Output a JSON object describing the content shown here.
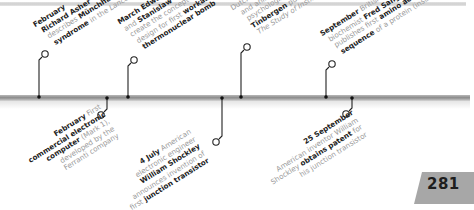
{
  "page": {
    "number": "281"
  },
  "colors": {
    "bar": "#8c8c8c",
    "connector": "#222222",
    "bold_text": "#222222",
    "muted_text": "#9a9a9a",
    "page_tab": "#a7a7a7"
  },
  "events_above": [
    {
      "month": "February",
      "lines": [
        "Richard Asher",
        "describes Münchhausen",
        "syndrome in the Lancet"
      ],
      "rich": [
        [
          "Richard Asher",
          "b"
        ],
        [
          "describes ",
          ""
        ],
        [
          "Münchhausen",
          "b"
        ],
        [
          "syndrome",
          "b"
        ],
        [
          " in the ",
          ""
        ],
        [
          "Lancet",
          "it"
        ]
      ]
    },
    {
      "month": "March",
      "text": "Edward Teller and Stanislaw Ulam create the concept design for first workable thermonuclear bomb"
    },
    {
      "month": "",
      "text": "Dutch zoologist and animal psychologist Niko Tinbergen publishes The Study of Instinct"
    },
    {
      "month": "September",
      "text": "British biochemist Fred Sanger publishes first amino acid sequence of a protein (insulin)"
    }
  ],
  "events_below": [
    {
      "month": "February",
      "text": "First commercial electronic computer (Mark 1), developed by the Ferranti company"
    },
    {
      "month": "4 July",
      "text": "American electronic engineer William Shockley announces invention of first junction transistor"
    },
    {
      "month": "25 September",
      "text": "American inventor William Shockley obtains patent for his junction transistor"
    }
  ],
  "text": {
    "a1_l1": "February",
    "a1_l2": "Richard Asher",
    "a1_l3a": "describes ",
    "a1_l3b": "Münchhausen",
    "a1_l4a": "syndrome",
    "a1_l4b": " in the ",
    "a1_l4c": "Lancet",
    "a2_l1": "March Edward Teller",
    "a2_l2a": "and ",
    "a2_l2b": "Stanislaw Ulam",
    "a2_l3": "create the concept",
    "a2_l4a": "design for first ",
    "a2_l4b": "workable",
    "a2_l5": "thermonuclear bomb",
    "a3_l1": "Dutch zoologist",
    "a3_l2": "and animal",
    "a3_l3a": "psychologist ",
    "a3_l3b": "Niko",
    "a3_l4a": "Tinbergen",
    "a3_l4b": " publishes",
    "a3_l5": "The Study of Instinct",
    "a4_l1a": "September",
    "a4_l1b": " British",
    "a4_l2a": "biochemist ",
    "a4_l2b": "Fred Sanger",
    "a4_l3a": "publishes first ",
    "a4_l3b": "amino acid",
    "a4_l4a": "sequence",
    "a4_l4b": " of a protein (insulin)",
    "b1_l1a": "February",
    "b1_l1b": " First",
    "b1_l2": "commercial electronic",
    "b1_l3a": "computer",
    "b1_l3b": " (Mark 1),",
    "b1_l4": "developed by the",
    "b1_l5": "Ferranti company",
    "b2_l1a": "4 July",
    "b2_l1b": " American",
    "b2_l2": "electronic engineer",
    "b2_l3": "William Shockley",
    "b2_l4": "announces invention of",
    "b2_l5a": "first ",
    "b2_l5b": "junction transistor",
    "b3_l1": "25 September",
    "b3_l2": "American inventor William",
    "b3_l3a": "Shockley ",
    "b3_l3b": "obtains patent",
    "b3_l3c": " for",
    "b3_l4": "his junction transistor"
  }
}
